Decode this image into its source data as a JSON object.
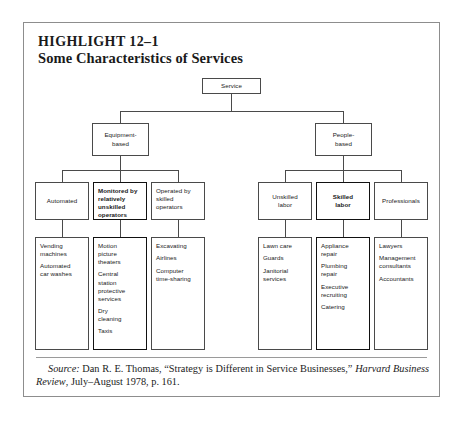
{
  "exhibit": {
    "highlight_label": "HIGHLIGHT 12–1",
    "title": "Some Characteristics of Services"
  },
  "chart_data": {
    "type": "diagram",
    "title": "Some Characteristics of Services",
    "orientation": "top-down-tree",
    "root": "Service",
    "levels": 4
  },
  "tree": {
    "root": {
      "label": "Service"
    },
    "level2": [
      {
        "label": "Equipment-\nbased"
      },
      {
        "label": "People-\nbased"
      }
    ],
    "level3": [
      {
        "label": "Automated",
        "bold": false
      },
      {
        "label": "Monitored by\nrelatively\nunskilled\noperators",
        "bold": true
      },
      {
        "label": "Operated by\nskilled\noperators",
        "bold": false
      },
      {
        "label": "Unskilled\nlabor",
        "bold": false
      },
      {
        "label": "Skilled\nlabor",
        "bold": true
      },
      {
        "label": "Professionals",
        "bold": false
      }
    ],
    "leaves": [
      {
        "bold": false,
        "items": [
          "Vending\nmachines",
          "Automated\ncar washes"
        ]
      },
      {
        "bold": true,
        "items": [
          "Motion\npicture\ntheaters",
          "Central\nstation\nprotective\nservices",
          "Dry\ncleaning",
          "Taxis"
        ]
      },
      {
        "bold": false,
        "items": [
          "Excavating",
          "Airlines",
          "Computer\ntime-sharing"
        ]
      },
      {
        "bold": false,
        "items": [
          "Lawn care",
          "Guards",
          "Janitorial\nservices"
        ]
      },
      {
        "bold": true,
        "items": [
          "Appliance\nrepair",
          "Plumbing\nrepair",
          "Executive\nrecruiting",
          "Catering"
        ]
      },
      {
        "bold": false,
        "items": [
          "Lawyers",
          "Management\nconsultants",
          "Accountants"
        ]
      }
    ]
  },
  "source": {
    "label": "Source:",
    "text_before_italic": " Dan R. E. Thomas, “Strategy is Different in Service Businesses,” ",
    "italic_title": "Harvard Business Review",
    "text_after_italic": ", July–August 1978, p. 161."
  }
}
